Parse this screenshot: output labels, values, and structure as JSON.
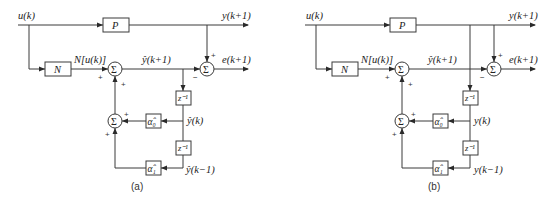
{
  "diagrams": [
    {
      "caption": "(a)",
      "input_label": "u(k)",
      "plant_label": "P",
      "plant_output_label": "y(k+1)",
      "model_label": "N",
      "model_output_label": "N[u(k)]",
      "sum_symbol": "Σ",
      "estimate_label": "ŷ(k+1)",
      "error_label": "e(k+1)",
      "delay_label": "z⁻¹",
      "coef0_label": "α̂₀",
      "coef1_label": "α̂₁",
      "tap0_label": "ŷ(k)",
      "tap1_label": "ŷ(k−1)",
      "signs": {
        "plus": "+",
        "minus": "−"
      }
    },
    {
      "caption": "(b)",
      "input_label": "u(k)",
      "plant_label": "P",
      "plant_output_label": "y(k+1)",
      "model_label": "N",
      "model_output_label": "N[u(k)]",
      "sum_symbol": "Σ",
      "estimate_label": "ŷ(k+1)",
      "error_label": "e(k+1)",
      "delay_label": "z⁻¹",
      "coef0_label": "α̂₀",
      "coef1_label": "α̂₁",
      "tap0_label": "y(k)",
      "tap1_label": "y(k−1)",
      "signs": {
        "plus": "+",
        "minus": "−"
      }
    }
  ]
}
